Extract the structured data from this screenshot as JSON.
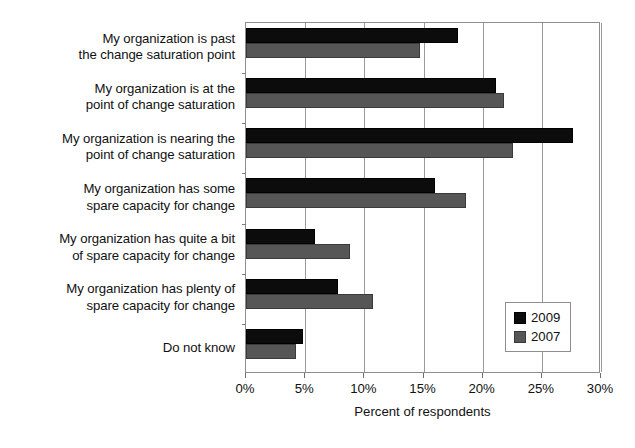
{
  "chart_data": {
    "type": "bar",
    "orientation": "horizontal",
    "title": "",
    "xlabel": "Percent of respondents",
    "ylabel": "",
    "xlim": [
      0,
      30
    ],
    "xticks": [
      "0%",
      "5%",
      "10%",
      "15%",
      "20%",
      "25%",
      "30%"
    ],
    "xtick_values": [
      0,
      5,
      10,
      15,
      20,
      25,
      30
    ],
    "grid": true,
    "grid_axis": "x",
    "legend_position": "bottom-right",
    "categories": [
      "My organization is past the change saturation point",
      "My organization is at the point of change saturation",
      "My organization is nearing the point of change saturation",
      "My organization has some spare capacity for change",
      "My organization has quite a bit of spare capacity for change",
      "My organization has plenty of spare capacity for change",
      "Do not know"
    ],
    "category_lines": [
      [
        "My organization is past",
        "the change saturation point"
      ],
      [
        "My organization is at the",
        "point of change saturation"
      ],
      [
        "My organization is nearing the",
        "point of change saturation"
      ],
      [
        "My organization has some",
        "spare capacity for change"
      ],
      [
        "My organization has quite a bit",
        "of spare capacity for change"
      ],
      [
        "My organization has plenty of",
        "spare capacity for change"
      ],
      [
        "Do not know"
      ]
    ],
    "series": [
      {
        "name": "2009",
        "color": "#0c0c0c",
        "values": [
          17.9,
          21.1,
          27.6,
          16.0,
          5.8,
          7.8,
          4.8
        ]
      },
      {
        "name": "2007",
        "color": "#565656",
        "values": [
          14.7,
          21.8,
          22.6,
          18.6,
          8.8,
          10.7,
          4.2
        ]
      }
    ]
  },
  "legend": {
    "items": [
      {
        "label": "2009"
      },
      {
        "label": "2007"
      }
    ]
  },
  "colors": {
    "series_2009": "#0c0c0c",
    "series_2007": "#565656",
    "axis": "#8e8e8e",
    "grid": "#9a9a9a",
    "text": "#111111",
    "background": "#ffffff"
  }
}
